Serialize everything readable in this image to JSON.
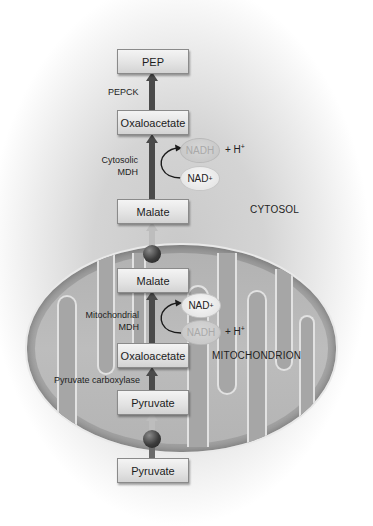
{
  "regions": {
    "cytosol_label": "CYTOSOL",
    "mitochondrion_label": "MITOCHONDRION"
  },
  "cytosol": {
    "metabolites": {
      "pep": "PEP",
      "oxaloacetate": "Oxaloacetate",
      "malate": "Malate",
      "pyruvate": "Pyruvate"
    },
    "enzymes": {
      "pepck": "PEPCK",
      "cytosolic_mdh_line1": "Cytosolic",
      "cytosolic_mdh_line2": "MDH"
    },
    "cofactors": {
      "nadh": "NADH",
      "nad": "NAD",
      "nad_sup": "+",
      "h_plus": "+ H",
      "h_sup": "+"
    }
  },
  "mitochondrion": {
    "metabolites": {
      "malate": "Malate",
      "oxaloacetate": "Oxaloacetate",
      "pyruvate": "Pyruvate"
    },
    "enzymes": {
      "mito_mdh_line1": "Mitochondrial",
      "mito_mdh_line2": "MDH",
      "pyruvate_carboxylase": "Pyruvate carboxylase"
    },
    "cofactors": {
      "nad": "NAD",
      "nad_sup": "+",
      "nadh": "NADH",
      "h_plus": "+ H",
      "h_sup": "+"
    }
  },
  "colors": {
    "arrow": "#4a4a4a",
    "transporter": "#2e2e2e",
    "box_fill": "#e6e6e6",
    "mito_fill": "#a8a8a8",
    "membrane": "#e6e6e6"
  }
}
